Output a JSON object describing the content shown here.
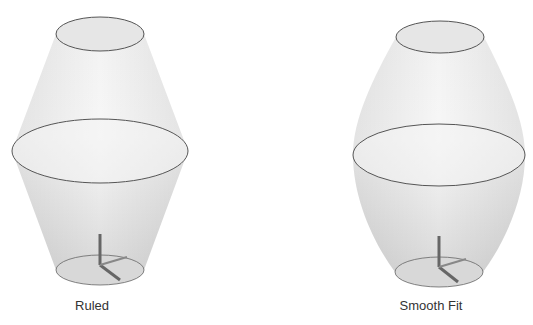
{
  "figures": [
    {
      "id": "ruled",
      "label": "Ruled",
      "type": "ruled-loft"
    },
    {
      "id": "smooth",
      "label": "Smooth Fit",
      "type": "smooth-loft"
    }
  ],
  "colors": {
    "surface": "#e4e4e4",
    "outline": "#555555",
    "axis": "#555555"
  }
}
